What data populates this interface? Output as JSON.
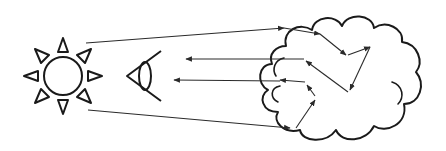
{
  "diagram": {
    "title": "",
    "elements": [
      {
        "id": "sun",
        "icon": "sun-icon",
        "description": "Light source with 8 triangular rays"
      },
      {
        "id": "eye",
        "icon": "eye-icon",
        "description": "Observer eye facing right"
      },
      {
        "id": "cloud",
        "icon": "cloud-icon",
        "description": "Scattering medium"
      }
    ],
    "paths": [
      {
        "name": "incident-ray-top",
        "from": "sun",
        "to": "cloud",
        "description": "Light enters cloud at top and scatters internally"
      },
      {
        "name": "incident-ray-bottom",
        "from": "sun",
        "to": "cloud",
        "description": "Light enters cloud at bottom and scatters internally"
      },
      {
        "name": "scattered-ray-upper",
        "from": "cloud",
        "to": "eye"
      },
      {
        "name": "scattered-ray-lower",
        "from": "cloud",
        "to": "eye"
      }
    ],
    "colors": {
      "stroke": "#1a1a1a",
      "background": "#ffffff"
    }
  }
}
